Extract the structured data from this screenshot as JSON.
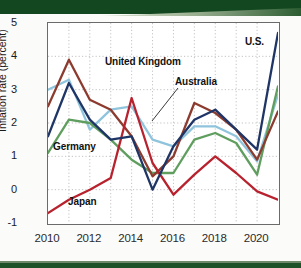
{
  "chart_data": {
    "type": "line",
    "title": "",
    "xlabel": "",
    "ylabel": "Inflation rate (percent)",
    "xlim": [
      2010,
      2021
    ],
    "ylim": [
      -1,
      5
    ],
    "yticks": [
      "5",
      "4",
      "3",
      "2",
      "1",
      "0",
      "-1"
    ],
    "ytick_values": [
      5,
      4,
      3,
      2,
      1,
      0,
      -1
    ],
    "xticks": [
      "2010",
      "2012",
      "2014",
      "2016",
      "2018",
      "2020"
    ],
    "xtick_values": [
      2010,
      2012,
      2014,
      2016,
      2018,
      2020
    ],
    "grid": "dotted-both",
    "legend": "inline-labels",
    "x": [
      2010,
      2011,
      2012,
      2013,
      2014,
      2015,
      2016,
      2017,
      2018,
      2019,
      2020,
      2021
    ],
    "series": [
      {
        "name": "U.S.",
        "label": "U.S.",
        "color": "#1f3566",
        "values": [
          1.6,
          3.2,
          2.1,
          1.5,
          1.6,
          0.0,
          1.3,
          2.1,
          2.4,
          1.8,
          1.2,
          4.7
        ]
      },
      {
        "name": "United Kingdom",
        "label": "United Kingdom",
        "color": "#8c3b2e",
        "values": [
          2.5,
          3.9,
          2.7,
          2.4,
          1.6,
          0.4,
          1.0,
          2.6,
          2.3,
          1.8,
          0.9,
          2.35
        ]
      },
      {
        "name": "Australia",
        "label": "Australia",
        "color": "#8fc4dc",
        "values": [
          3.0,
          3.3,
          1.8,
          2.4,
          2.5,
          1.5,
          1.3,
          1.9,
          1.9,
          1.6,
          0.85,
          2.85
        ]
      },
      {
        "name": "Germany",
        "label": "Germany",
        "color": "#5f9e5f",
        "values": [
          1.1,
          2.1,
          2.0,
          1.5,
          0.9,
          0.5,
          0.5,
          1.5,
          1.7,
          1.4,
          0.45,
          3.1
        ]
      },
      {
        "name": "Japan",
        "label": "Japan",
        "color": "#b8222e",
        "values": [
          -0.7,
          -0.3,
          0.0,
          0.35,
          2.75,
          0.8,
          -0.15,
          0.45,
          1.0,
          0.5,
          -0.05,
          -0.3
        ]
      }
    ]
  }
}
